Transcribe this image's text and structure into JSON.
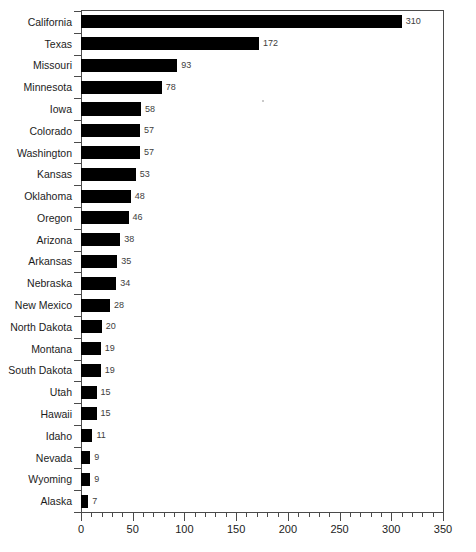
{
  "chart_data": {
    "type": "bar",
    "orientation": "horizontal",
    "title": "",
    "subtitle": "",
    "xlabel": "",
    "ylabel": "",
    "xlim": [
      0,
      350
    ],
    "grid": false,
    "legend": null,
    "bar_color": "#000000",
    "value_label_color": "#3d3d3d",
    "axis_color": "#4a4a4a",
    "x_major_ticks": [
      0,
      50,
      100,
      150,
      200,
      250,
      300,
      350
    ],
    "x_tick_labels": [
      "0",
      "50",
      "100",
      "150",
      "200",
      "250",
      "300",
      "350"
    ],
    "x_minor_tick_interval": 10,
    "categories": [
      "California",
      "Texas",
      "Missouri",
      "Minnesota",
      "Iowa",
      "Colorado",
      "Washington",
      "Kansas",
      "Oklahoma",
      "Oregon",
      "Arizona",
      "Arkansas",
      "Nebraska",
      "New Mexico",
      "North Dakota",
      "Montana",
      "South Dakota",
      "Utah",
      "Hawaii",
      "Idaho",
      "Nevada",
      "Wyoming",
      "Alaska"
    ],
    "values": [
      310,
      172,
      93,
      78,
      58,
      57,
      57,
      53,
      48,
      46,
      38,
      35,
      34,
      28,
      20,
      19,
      19,
      15,
      15,
      11,
      9,
      9,
      7
    ],
    "value_labels": [
      "310",
      "172",
      "93",
      "78",
      "58",
      "57",
      "57",
      "53",
      "48",
      "46",
      "38",
      "35",
      "34",
      "28",
      "20",
      "19",
      "19",
      "15",
      "15",
      "11",
      "9",
      "9",
      "7"
    ]
  }
}
